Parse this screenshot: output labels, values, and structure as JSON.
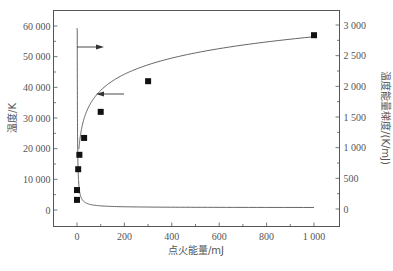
{
  "chart_data": {
    "type": "line",
    "title": "",
    "xlabel": "点火能量/mJ",
    "ylabel_left": "温度/K",
    "ylabel_right": "温度能量梯度/(K/mJ)",
    "xlim": [
      -40,
      1060
    ],
    "ylim_left": [
      -5000,
      65000
    ],
    "ylim_right": [
      -250,
      3250
    ],
    "x_ticks": [
      0,
      200,
      400,
      600,
      800,
      1000
    ],
    "x_tick_labels": [
      "0",
      "200",
      "400",
      "600",
      "800",
      "1 000"
    ],
    "y_left_ticks": [
      0,
      10000,
      20000,
      30000,
      40000,
      50000,
      60000
    ],
    "y_left_tick_labels": [
      "0",
      "10 000",
      "20 000",
      "30 000",
      "40 000",
      "50 000",
      "60 000"
    ],
    "y_right_ticks": [
      0,
      500,
      1000,
      1500,
      2000,
      2500,
      3000
    ],
    "y_right_tick_labels": [
      "0",
      "500",
      "1 000",
      "1 500",
      "2 000",
      "2 500",
      "3 000"
    ],
    "grid": false,
    "legend": "none",
    "series": [
      {
        "name": "温度",
        "axis": "left",
        "style": "square markers with fitted curve",
        "x": [
          1,
          2,
          5,
          10,
          30,
          100,
          300,
          1000
        ],
        "values": [
          3300,
          6500,
          13300,
          18000,
          23500,
          32000,
          42000,
          57000
        ]
      },
      {
        "name": "温度能量梯度",
        "axis": "right",
        "style": "line",
        "x": [
          1,
          3,
          5,
          10,
          20,
          50,
          100,
          200,
          400,
          700,
          1000
        ],
        "values": [
          2950,
          1100,
          600,
          380,
          210,
          110,
          70,
          50,
          35,
          28,
          25
        ]
      }
    ],
    "annotations": [
      {
        "type": "arrow",
        "direction": "right",
        "points_to": "right axis",
        "near_series": "温度能量梯度"
      },
      {
        "type": "arrow",
        "direction": "left",
        "points_to": "left axis",
        "near_series": "温度"
      }
    ]
  }
}
